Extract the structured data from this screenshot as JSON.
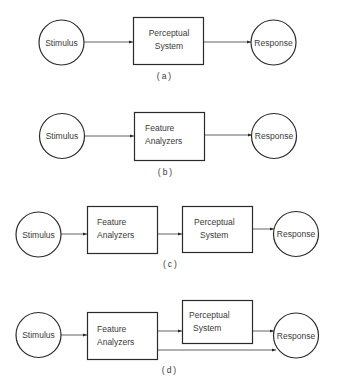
{
  "diagram": {
    "panels": [
      {
        "label": "(a)",
        "nodes": {
          "stimulus": "Stimulus",
          "box1_line1": "Perceptual",
          "box1_line2": "System",
          "response": "Response"
        }
      },
      {
        "label": "(b)",
        "nodes": {
          "stimulus": "Stimulus",
          "box1_line1": "Feature",
          "box1_line2": "Analyzers",
          "response": "Response"
        }
      },
      {
        "label": "(c)",
        "nodes": {
          "stimulus": "Stimulus",
          "box1_line1": "Feature",
          "box1_line2": "Analyzers",
          "box2_line1": "Perceptual",
          "box2_line2": "System",
          "response": "Response"
        }
      },
      {
        "label": "(d)",
        "nodes": {
          "stimulus": "Stimulus",
          "box1_line1": "Feature",
          "box1_line2": "Analyzers",
          "box2_line1": "Perceptual",
          "box2_line2": "System",
          "response": "Response"
        }
      }
    ],
    "colors": {
      "stroke": "#2a2a2a",
      "text": "#3a3a3a",
      "background": "#ffffff"
    }
  }
}
